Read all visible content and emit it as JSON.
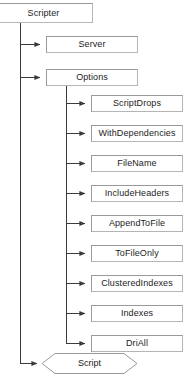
{
  "diagram": {
    "type": "hierarchy-tree",
    "root": {
      "label": "Scripter",
      "shape": "rectangle"
    },
    "children": [
      {
        "label": "Server",
        "shape": "rectangle"
      },
      {
        "label": "Options",
        "shape": "rectangle"
      }
    ],
    "options_children": [
      {
        "label": "ScriptDrops",
        "shape": "rectangle"
      },
      {
        "label": "WithDependencies",
        "shape": "rectangle"
      },
      {
        "label": "FileName",
        "shape": "rectangle"
      },
      {
        "label": "IncludeHeaders",
        "shape": "rectangle"
      },
      {
        "label": "AppendToFile",
        "shape": "rectangle"
      },
      {
        "label": "ToFileOnly",
        "shape": "rectangle"
      },
      {
        "label": "ClusteredIndexes",
        "shape": "rectangle"
      },
      {
        "label": "Indexes",
        "shape": "rectangle"
      },
      {
        "label": "DriAll",
        "shape": "rectangle"
      }
    ],
    "method": {
      "label": "Script",
      "shape": "hexagon"
    },
    "colors": {
      "background": "#ffffff",
      "box_border": "#9a9a9a",
      "box_fill": "#ffffff",
      "connector": "#3a3a3a",
      "text": "#1c1c1c"
    }
  }
}
